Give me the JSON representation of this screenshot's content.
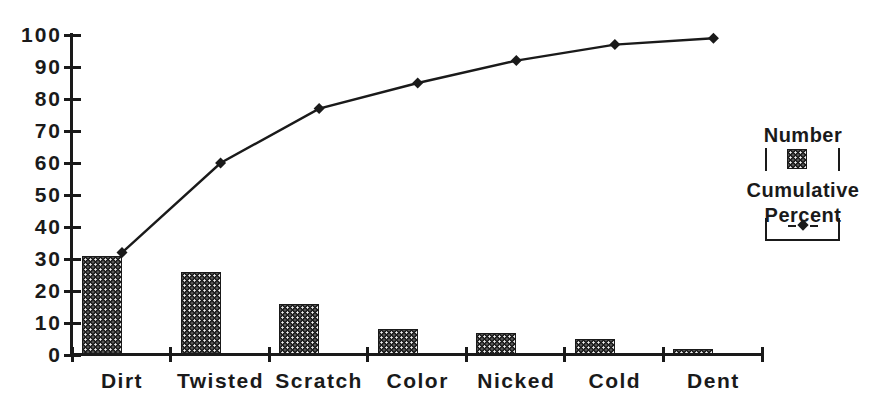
{
  "chart_data": {
    "type": "bar",
    "subtype": "pareto-combo",
    "title": "",
    "xlabel": "",
    "ylabel": "",
    "categories": [
      "Dirt",
      "Twisted",
      "Scratch",
      "Color",
      "Nicked",
      "Cold",
      "Dent"
    ],
    "series": [
      {
        "name": "Number",
        "type": "bar",
        "values": [
          31,
          26,
          16,
          8,
          7,
          5,
          2
        ]
      },
      {
        "name": "Cumulative Percent",
        "type": "line",
        "marker": "diamond",
        "values": [
          32,
          60,
          77,
          85,
          92,
          97,
          99
        ]
      }
    ],
    "ylim": [
      0,
      100
    ],
    "ytick_step": 10,
    "ytick_labels": [
      "0",
      "10",
      "20",
      "30",
      "40",
      "50",
      "60",
      "70",
      "80",
      "90",
      "100"
    ],
    "grid": false,
    "legend_position": "right"
  },
  "legend": {
    "number_label": "Number",
    "cumulative_line1": "Cumulative",
    "cumulative_line2": "Percent"
  },
  "colors": {
    "ink": "#1a1a1a",
    "paper": "#ffffff"
  }
}
